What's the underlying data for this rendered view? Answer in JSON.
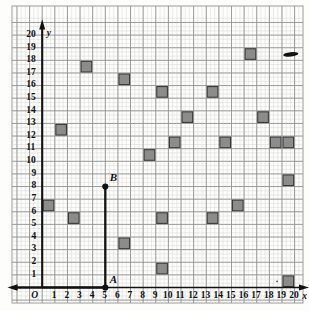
{
  "figure": {
    "kind": "coordinate-grid-plot",
    "origin_label": "O",
    "x_axis_name": "x",
    "y_axis_name": "y",
    "x_ticks": [
      "1",
      "2",
      "3",
      "4",
      "5",
      "6",
      "7",
      "8",
      "9",
      "10",
      "11",
      "12",
      "13",
      "14",
      "15",
      "16",
      "17",
      "18",
      "19",
      "20"
    ],
    "y_ticks": [
      "1",
      "2",
      "3",
      "4",
      "5",
      "6",
      "7",
      "8",
      "9",
      "10",
      "11",
      "12",
      "13",
      "14",
      "15",
      "16",
      "17",
      "18",
      "19",
      "20"
    ],
    "point_labels": [
      {
        "name": "A",
        "text": "A",
        "x": 5,
        "y": 0
      },
      {
        "name": "B",
        "text": "B",
        "x": 5,
        "y": 8
      }
    ],
    "colors": {
      "square_fill": "#8c8c8c",
      "square_stroke": "#3a3a3a",
      "grid_minor": "#c9c9c9",
      "grid_major": "#8f8f8f",
      "axis": "#111111",
      "frame": "#9a9a9a",
      "paper": "#fdfdfb"
    }
  },
  "chart_data": {
    "type": "scatter",
    "title": "",
    "xlabel": "x",
    "ylabel": "y",
    "xlim": [
      0,
      20
    ],
    "ylim": [
      0,
      20
    ],
    "grid": true,
    "legend": "none",
    "marker": "filled-square-cell",
    "note": "Each gray square occupies one unit cell; x,y give the lower-left corner of the cell.",
    "squares": [
      {
        "x": 3,
        "y": 17
      },
      {
        "x": 6,
        "y": 16
      },
      {
        "x": 1,
        "y": 12
      },
      {
        "x": 9,
        "y": 15
      },
      {
        "x": 13,
        "y": 15
      },
      {
        "x": 16,
        "y": 18
      },
      {
        "x": 17,
        "y": 13
      },
      {
        "x": 19,
        "y": 11
      },
      {
        "x": 0,
        "y": 6
      },
      {
        "x": 8,
        "y": 10
      },
      {
        "x": 10,
        "y": 11
      },
      {
        "x": 14,
        "y": 11
      },
      {
        "x": 18,
        "y": 11
      },
      {
        "x": 11,
        "y": 13
      },
      {
        "x": 2,
        "y": 5
      },
      {
        "x": 9,
        "y": 5
      },
      {
        "x": 15,
        "y": 6
      },
      {
        "x": 19,
        "y": 8
      },
      {
        "x": 6,
        "y": 3
      },
      {
        "x": 13,
        "y": 5
      },
      {
        "x": 9,
        "y": 1
      },
      {
        "x": 19,
        "y": 0
      }
    ],
    "segment": {
      "name": "AB",
      "from": {
        "x": 5,
        "y": 0
      },
      "to": {
        "x": 5,
        "y": 8
      }
    },
    "x_axis_ray": {
      "from": {
        "x": 5,
        "y": 0
      },
      "to_left": true
    },
    "smudge": {
      "x": 19.1,
      "y": 18.3,
      "w": 1.2,
      "h": 0.35
    }
  }
}
